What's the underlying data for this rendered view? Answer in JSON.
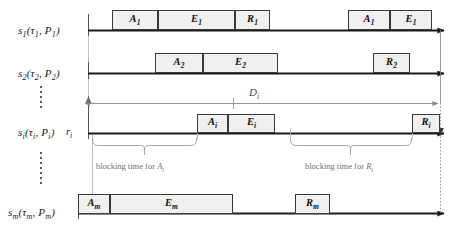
{
  "figure": {
    "type": "timing-diagram",
    "title": ""
  },
  "rows": [
    {
      "id": "s1",
      "label_main": "s",
      "label_sub": "1",
      "label_args": "(τ",
      "label_args_sub": "1",
      "label_args2": ", P",
      "label_args2_sub": "1",
      "label_close": ")",
      "full_label": "s1(τ1, P1)",
      "axis_y": 30,
      "axis_x1": 88,
      "axis_x2": 452,
      "blocks": [
        {
          "name": "A",
          "sub": "1",
          "x": 112,
          "w": 46
        },
        {
          "name": "E",
          "sub": "1",
          "x": 158,
          "w": 77
        },
        {
          "name": "R",
          "sub": "1",
          "x": 235,
          "w": 35
        },
        {
          "name": "A",
          "sub": "1",
          "x": 348,
          "w": 42
        },
        {
          "name": "E",
          "sub": "1",
          "x": 390,
          "w": 42
        }
      ]
    },
    {
      "id": "s2",
      "label_main": "s",
      "label_sub": "2",
      "full_label": "s2(τ2, P2)",
      "axis_y": 73,
      "axis_x1": 88,
      "axis_x2": 452,
      "blocks": [
        {
          "name": "A",
          "sub": "2",
          "x": 155,
          "w": 48
        },
        {
          "name": "E",
          "sub": "2",
          "x": 203,
          "w": 75
        },
        {
          "name": "R",
          "sub": "2",
          "x": 373,
          "w": 37
        }
      ]
    },
    {
      "id": "si",
      "label_main": "s",
      "label_sub": "i",
      "full_label": "si(τi, Pi)",
      "axis_y": 133,
      "axis_x1": 88,
      "axis_x2": 452,
      "blocks": [
        {
          "name": "A",
          "sub": "i",
          "x": 197,
          "w": 31
        },
        {
          "name": "E",
          "sub": "i",
          "x": 228,
          "w": 47
        },
        {
          "name": "R",
          "sub": "i",
          "x": 412,
          "w": 28
        }
      ]
    },
    {
      "id": "sm",
      "label_main": "s",
      "label_sub": "m",
      "full_label": "sm(τm, Pm)",
      "axis_y": 213,
      "axis_x1": 78,
      "axis_x2": 452,
      "blocks": [
        {
          "name": "A",
          "sub": "m",
          "x": 78,
          "w": 32
        },
        {
          "name": "E",
          "sub": "m",
          "x": 110,
          "w": 123
        },
        {
          "name": "R",
          "sub": "m",
          "x": 295,
          "w": 35
        }
      ]
    }
  ],
  "labels": {
    "s1": {
      "base": "s",
      "sub1": "1",
      "tau_sub": "1",
      "p_sub": "1"
    },
    "s2": {
      "base": "s",
      "sub1": "2",
      "tau_sub": "2",
      "p_sub": "2"
    },
    "si": {
      "base": "s",
      "sub1": "i",
      "tau_sub": "i",
      "p_sub": "i"
    },
    "sm": {
      "base": "s",
      "sub1": "m",
      "tau_sub": "m",
      "p_sub": "m"
    },
    "tau": "τ",
    "P": "P",
    "release": "r",
    "release_sub": "i",
    "deadline": "D",
    "deadline_sub": "i"
  },
  "annotations": [
    {
      "id": "blocking-ai",
      "text": "blocking time for ",
      "symbol": "A",
      "symbol_sub": "i",
      "brace_x1": 92,
      "brace_x2": 197,
      "brace_y": 140,
      "text_x": 96,
      "text_y": 164
    },
    {
      "id": "blocking-ri",
      "text": "blocking time for ",
      "symbol": "R",
      "symbol_sub": "i",
      "brace_x1": 290,
      "brace_x2": 412,
      "brace_y": 140,
      "text_x": 305,
      "text_y": 164
    }
  ],
  "deadline_arrow": {
    "label": "D",
    "label_sub": "i",
    "x1": 88,
    "x2": 440,
    "y": 103,
    "label_x": 249,
    "label_y": 89
  },
  "ellipses": [
    {
      "id": "dots-1",
      "x": 40,
      "y": 86,
      "count": 5
    },
    {
      "id": "dots-2",
      "x": 40,
      "y": 152,
      "count": 6
    }
  ],
  "colors": {
    "box_fill": "#f0f0ef",
    "box_border": "#3a3a3a",
    "axis": "#1a1a1a",
    "annotation_text": "#6f6f6f",
    "guide_line": "#9a9a9a",
    "deadline_line": "#8a8a8a",
    "label_text": "#1a1a1a",
    "background": "#ffffff"
  }
}
